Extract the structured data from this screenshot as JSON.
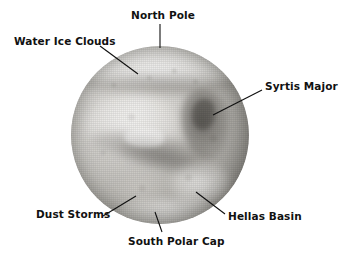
{
  "figure": {
    "background_color": "#ffffff",
    "image_type": "grayscale-photograph",
    "width": 350,
    "height": 256
  },
  "planet": {
    "name": "Mars",
    "center_x": 160,
    "center_y": 135,
    "radius": 89,
    "base_color": "#bfbdb8",
    "highlight_color": "#e6e5e2",
    "shadow_color": "#6f6c68"
  },
  "labels": [
    {
      "id": "north-pole",
      "text": "North Pole",
      "leader": {
        "x1": 160,
        "y1": 24,
        "x2": 160,
        "y2": 48
      }
    },
    {
      "id": "water-ice-clouds",
      "text": "Water Ice Clouds",
      "leader": {
        "x1": 100,
        "y1": 46,
        "x2": 138,
        "y2": 74
      }
    },
    {
      "id": "syrtis-major",
      "text": "Syrtis Major",
      "leader": {
        "x1": 262,
        "y1": 90,
        "x2": 213,
        "y2": 115
      }
    },
    {
      "id": "dust-storms",
      "text": "Dust Storms",
      "leader": {
        "x1": 103,
        "y1": 216,
        "x2": 136,
        "y2": 196
      }
    },
    {
      "id": "hellas-basin",
      "text": "Hellas Basin",
      "leader": {
        "x1": 225,
        "y1": 214,
        "x2": 196,
        "y2": 192
      }
    },
    {
      "id": "south-polar-cap",
      "text": "South Polar Cap",
      "leader": {
        "x1": 162,
        "y1": 232,
        "x2": 155,
        "y2": 212
      }
    }
  ],
  "features": [
    {
      "id": "north-polar-hood",
      "name": "north polar hood"
    },
    {
      "id": "syrtis-major-region",
      "name": "Syrtis Major dark region"
    },
    {
      "id": "hellas-basin-region",
      "name": "Hellas Basin bright oval"
    },
    {
      "id": "south-polar-cap-region",
      "name": "south polar cap"
    },
    {
      "id": "dust-storm-region",
      "name": "dust storm patch"
    }
  ],
  "colors": {
    "leader_line": "#0f0f0f",
    "label_text": "#111111",
    "page_background": "#ffffff"
  }
}
